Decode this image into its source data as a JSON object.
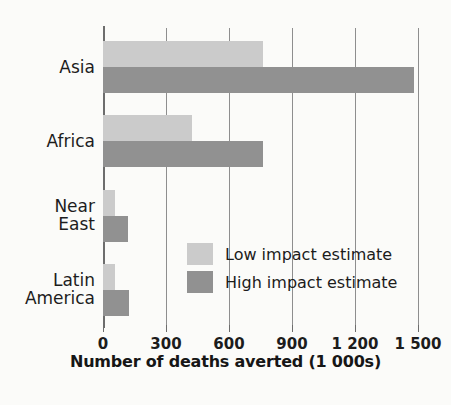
{
  "chart_data": {
    "type": "bar",
    "orientation": "horizontal",
    "title": "",
    "xlabel": "Number of deaths averted (1 000s)",
    "ylabel": "",
    "xlim": [
      0,
      1500
    ],
    "xticks": [
      0,
      300,
      600,
      900,
      1200,
      1500
    ],
    "xticklabels": [
      "0",
      "300",
      "600",
      "900",
      "1 200",
      "1 500"
    ],
    "grid": true,
    "grid_axis": "x",
    "legend_position": "center-right-inside",
    "categories": [
      "Asia",
      "Africa",
      "Near East",
      "Latin America"
    ],
    "category_display": [
      "Asia",
      "Africa",
      "Near\nEast",
      "Latin\nAmerica"
    ],
    "series": [
      {
        "name": "Low impact estimate",
        "color": "#cbcbcb",
        "values": [
          760,
          425,
          55,
          55
        ]
      },
      {
        "name": "High impact estimate",
        "color": "#919191",
        "values": [
          1480,
          760,
          120,
          125
        ]
      }
    ]
  },
  "colors": {
    "low": "#cbcbcb",
    "high": "#919191",
    "axis": "#6d6d6d",
    "grid": "#8e8e8e",
    "text": "#1c1c1c",
    "background": "#fbfbf9"
  }
}
